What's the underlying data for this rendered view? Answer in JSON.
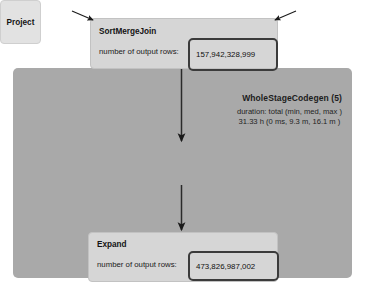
{
  "diagram": {
    "title_semantic": "spark-query-execution-plan",
    "background_color": "#ffffff",
    "region_color": "#a9a9a9",
    "node_color": "#d6d6d6",
    "highlight_color": "#3b3b3b"
  },
  "codegen": {
    "title": "WholeStageCodegen (5)",
    "metric_header": "duration: total (min, med, max )",
    "metric_value": "31.33 h (0 ms, 9.3 m, 16.1 m )"
  },
  "nodes": {
    "sort_merge_join": {
      "title": "SortMergeJoin",
      "metric_label": "number of output rows:",
      "metric_value": "157,942,328,999"
    },
    "project": {
      "title": "Project"
    },
    "expand": {
      "title": "Expand",
      "metric_label": "number of output rows:",
      "metric_value": "473,826,987,002"
    }
  }
}
